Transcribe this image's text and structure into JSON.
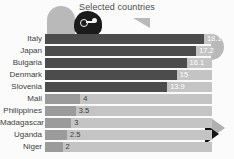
{
  "chart_data": {
    "type": "bar",
    "orientation": "horizontal",
    "title": "Selected countries",
    "xlabel": "",
    "ylabel": "",
    "xlim": [
      0,
      19
    ],
    "grid": false,
    "legend": null,
    "categories": [
      "Italy",
      "Japan",
      "Bulgaria",
      "Denmark",
      "Slovenia",
      "Mali",
      "Philippines",
      "Madagascar",
      "Uganda",
      "Niger"
    ],
    "values": [
      18.1,
      17.2,
      16.1,
      15,
      13.9,
      4,
      3.5,
      3,
      2.5,
      2
    ],
    "value_labels": [
      "18.1",
      "17.2",
      "16.1",
      "15",
      "13.9",
      "4",
      "3.5",
      "3",
      "2.5",
      "2"
    ],
    "bars": [
      {
        "label": "Italy",
        "value": 18.1,
        "value_label": "18.1",
        "group": "high"
      },
      {
        "label": "Japan",
        "value": 17.2,
        "value_label": "17.2",
        "group": "high"
      },
      {
        "label": "Bulgaria",
        "value": 16.1,
        "value_label": "16.1",
        "group": "high"
      },
      {
        "label": "Denmark",
        "value": 15,
        "value_label": "15",
        "group": "high"
      },
      {
        "label": "Slovenia",
        "value": 13.9,
        "value_label": "13.9",
        "group": "high"
      },
      {
        "label": "Mali",
        "value": 4,
        "value_label": "4",
        "group": "low"
      },
      {
        "label": "Philippines",
        "value": 3.5,
        "value_label": "3.5",
        "group": "low"
      },
      {
        "label": "Madagascar",
        "value": 3,
        "value_label": "3",
        "group": "low"
      },
      {
        "label": "Uganda",
        "value": 2.5,
        "value_label": "2.5",
        "group": "low"
      },
      {
        "label": "Niger",
        "value": 2,
        "value_label": "2",
        "group": "low"
      }
    ]
  },
  "colors": {
    "background": "#fbfbfb",
    "bar_high": "#4c4c4c",
    "bar_low": "#9b9b9b",
    "track": "#c4c4c4",
    "value_high": "#ffffff",
    "value_low": "#3b3b3b",
    "label": "#3d3d3d",
    "title": "#4a4a4a",
    "decor_gray": "#b9b9b9",
    "decor_dark": "#1b1b1b"
  },
  "decorations": {
    "dome": "gray-quarter-dome",
    "triangle_left": "gray-left-triangle",
    "blob": "dark-blob-with-key",
    "half_circle": "gray-half-circle",
    "arrow": "black-right-arrow"
  }
}
